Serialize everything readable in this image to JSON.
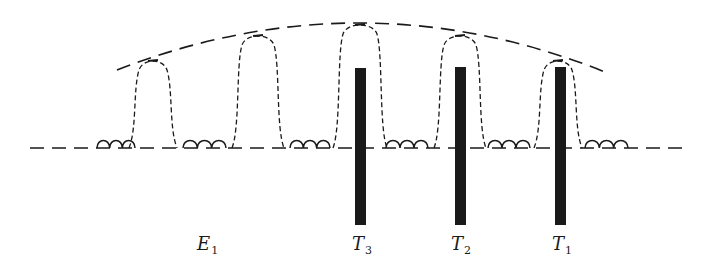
{
  "figure": {
    "baseline": {
      "y": 148,
      "x_start": 30,
      "x_end": 683
    },
    "envelope": {
      "left": [
        117,
        70
      ],
      "peak": [
        362,
        23
      ],
      "right": [
        605,
        72
      ]
    },
    "peaks": [
      {
        "id": "p1",
        "x": 153,
        "top_y": 60,
        "half_width": 24
      },
      {
        "id": "p2",
        "x": 258,
        "top_y": 35,
        "half_width": 26
      },
      {
        "id": "p3",
        "x": 360,
        "top_y": 24,
        "half_width": 27
      },
      {
        "id": "p4",
        "x": 460,
        "top_y": 35,
        "half_width": 26
      },
      {
        "id": "p5",
        "x": 558,
        "top_y": 60,
        "half_width": 24
      }
    ],
    "ripples": [
      {
        "x_start": 97,
        "x_end": 135
      },
      {
        "x_start": 183,
        "x_end": 226
      },
      {
        "x_start": 290,
        "x_end": 330
      },
      {
        "x_start": 386,
        "x_end": 428
      },
      {
        "x_start": 488,
        "x_end": 530
      },
      {
        "x_start": 585,
        "x_end": 628
      }
    ],
    "bars": [
      {
        "id": "T3",
        "x": 355,
        "width": 11,
        "top_y": 68,
        "bottom_y": 225
      },
      {
        "id": "T2",
        "x": 455,
        "width": 11,
        "top_y": 67,
        "bottom_y": 225
      },
      {
        "id": "T1",
        "x": 555,
        "width": 11,
        "top_y": 67,
        "bottom_y": 225
      }
    ],
    "labels": [
      {
        "main": "E",
        "sub": "1",
        "x": 197,
        "y": 250
      },
      {
        "main": "T",
        "sub": "3",
        "x": 352,
        "y": 250
      },
      {
        "main": "T",
        "sub": "2",
        "x": 451,
        "y": 250
      },
      {
        "main": "T",
        "sub": "1",
        "x": 552,
        "y": 250
      }
    ],
    "colors": {
      "ink": "#1a1a1a",
      "background": "#ffffff"
    }
  }
}
